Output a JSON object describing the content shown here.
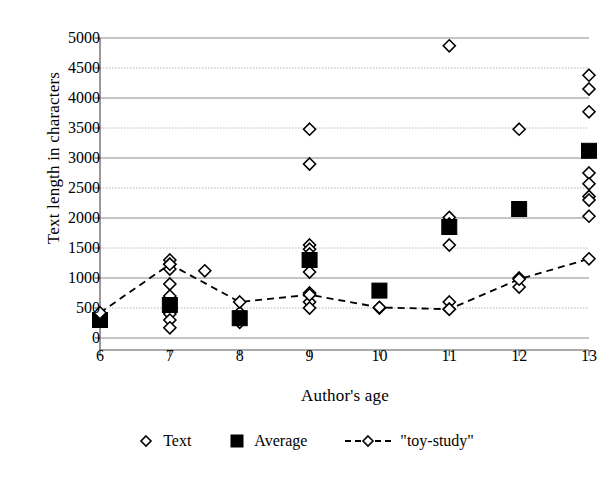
{
  "chart_data": {
    "type": "scatter",
    "title": "",
    "xlabel": "Author's age",
    "ylabel": "Text length in characters",
    "xlim": [
      6,
      13
    ],
    "ylim": [
      0,
      5000
    ],
    "xticks": [
      6,
      7,
      8,
      9,
      10,
      11,
      12,
      13
    ],
    "yticks": [
      0,
      500,
      1000,
      1500,
      2000,
      2500,
      3000,
      3500,
      4000,
      4500,
      5000
    ],
    "grid": true,
    "legend_position": "bottom",
    "series": [
      {
        "name": "Text",
        "marker": "open-diamond",
        "color": "#000000",
        "points": [
          [
            6,
            300
          ],
          [
            7,
            1300
          ],
          [
            7,
            1230
          ],
          [
            7,
            1150
          ],
          [
            7,
            900
          ],
          [
            7,
            700
          ],
          [
            7,
            400
          ],
          [
            7,
            300
          ],
          [
            7,
            170
          ],
          [
            7.5,
            1120
          ],
          [
            8,
            420
          ],
          [
            8,
            330
          ],
          [
            8,
            260
          ],
          [
            9,
            3480
          ],
          [
            9,
            2900
          ],
          [
            9,
            1550
          ],
          [
            9,
            1480
          ],
          [
            9,
            1400
          ],
          [
            9,
            1100
          ],
          [
            9,
            750
          ],
          [
            9,
            600
          ],
          [
            9,
            500
          ],
          [
            10,
            500
          ],
          [
            11,
            4870
          ],
          [
            11,
            2010
          ],
          [
            11,
            1900
          ],
          [
            11,
            1830
          ],
          [
            11,
            1550
          ],
          [
            11,
            600
          ],
          [
            11,
            480
          ],
          [
            12,
            3480
          ],
          [
            12,
            1000
          ],
          [
            12,
            850
          ],
          [
            13,
            4380
          ],
          [
            13,
            4150
          ],
          [
            13,
            3770
          ],
          [
            13,
            2750
          ],
          [
            13,
            2570
          ],
          [
            13,
            2360
          ],
          [
            13,
            2300
          ],
          [
            13,
            2030
          ]
        ]
      },
      {
        "name": "Average",
        "marker": "filled-square",
        "color": "#000000",
        "points": [
          [
            6,
            300
          ],
          [
            7,
            550
          ],
          [
            8,
            330
          ],
          [
            9,
            1300
          ],
          [
            10,
            790
          ],
          [
            11,
            1850
          ],
          [
            12,
            2150
          ],
          [
            13,
            3120
          ]
        ]
      },
      {
        "name": "\"toy-study\"",
        "marker": "open-diamond-dashed-line",
        "color": "#000000",
        "points": [
          [
            6,
            420
          ],
          [
            7,
            1230
          ],
          [
            8,
            600
          ],
          [
            9,
            720
          ],
          [
            10,
            510
          ],
          [
            11,
            480
          ],
          [
            12,
            980
          ],
          [
            13,
            1320
          ]
        ]
      }
    ]
  },
  "legend": {
    "entries": [
      {
        "label": "Text",
        "marker": "open-diamond"
      },
      {
        "label": "Average",
        "marker": "filled-square"
      },
      {
        "label": "\"toy-study\"",
        "marker": "dashed-diamond"
      }
    ]
  },
  "axes": {
    "y_title": "Text length in characters",
    "x_title": "Author's age",
    "y_tick_labels": [
      "5000",
      "4500",
      "4000",
      "3500",
      "3000",
      "2500",
      "2000",
      "1500",
      "1000",
      "500",
      "0"
    ],
    "x_tick_labels": [
      "6",
      "7",
      "8",
      "9",
      "10",
      "11",
      "12",
      "13"
    ]
  },
  "colors": {
    "marker": "#000000",
    "gridline_solid": "#8a8a8a",
    "gridline_dotted": "#b5b5b5",
    "axis": "#555555",
    "background": "#ffffff"
  }
}
